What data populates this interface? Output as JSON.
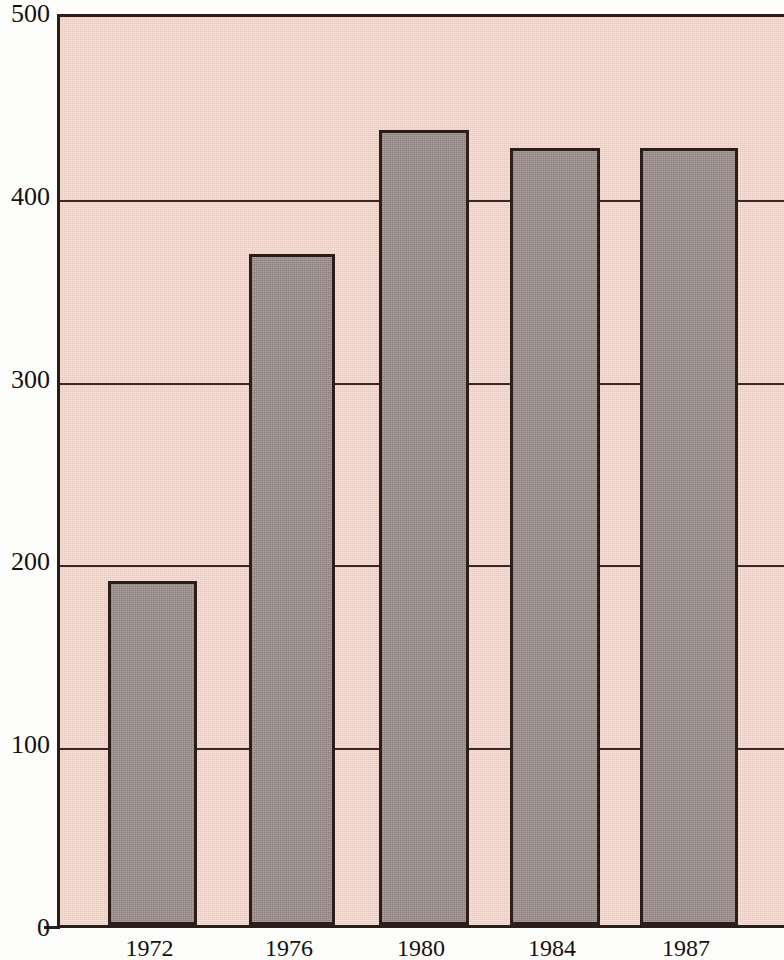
{
  "chart_data": {
    "type": "bar",
    "title": "",
    "subtitle": "",
    "xlabel": "",
    "ylabel": "",
    "categories": [
      "1972",
      "1976",
      "1980",
      "1984",
      "1987"
    ],
    "values": [
      188,
      367,
      435,
      425,
      425
    ],
    "series": [
      {
        "name": "",
        "values": [
          188,
          367,
          435,
          425,
          425
        ]
      }
    ],
    "ylim": [
      0,
      500
    ],
    "yticks": [
      0,
      100,
      200,
      300,
      400,
      500
    ],
    "ytick_labels": [
      "0",
      "100",
      "200",
      "300",
      "400",
      "500"
    ],
    "xtick_labels": [
      "1972",
      "1976",
      "1980",
      "1984",
      "1987"
    ],
    "grid": true,
    "grid_axis": "y",
    "legend": false,
    "legend_position": "none",
    "annotations": []
  },
  "style": {
    "plot_background": "#f0d5cb",
    "bar_fill": "#9a8d8a",
    "line_color": "#2b1d1a",
    "grid_color": "#3a2622",
    "text_color": "#16110f",
    "page_background": "#fdfdfb"
  },
  "geometry": {
    "plot_left_px": 57,
    "plot_top_px": 14,
    "baseline_y_px": 928,
    "px_per_100_units": 182.6,
    "bars": [
      {
        "label": "1972",
        "left_px": 105,
        "width_px": 89
      },
      {
        "label": "1976",
        "left_px": 246,
        "width_px": 86
      },
      {
        "label": "1980",
        "left_px": 376,
        "width_px": 90
      },
      {
        "label": "1984",
        "left_px": 507,
        "width_px": 90
      },
      {
        "label": "1987",
        "left_px": 637,
        "width_px": 98
      }
    ]
  }
}
